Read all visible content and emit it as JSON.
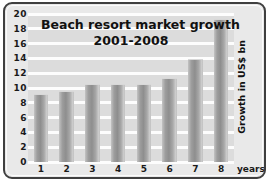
{
  "chart_data": {
    "type": "bar",
    "title": "Beach resort market growth",
    "subtitle": "2001-2008",
    "xlabel": "years",
    "ylabel": "Growth in US$ bn",
    "categories": [
      "1",
      "2",
      "3",
      "4",
      "5",
      "6",
      "7",
      "8"
    ],
    "values": [
      9.0,
      9.4,
      10.4,
      10.4,
      10.4,
      11.2,
      13.8,
      19.2
    ],
    "ylim": [
      0,
      20
    ],
    "ytick_step": 2,
    "yticks": [
      "20",
      "18",
      "16",
      "14",
      "12",
      "10",
      "8",
      "6",
      "4",
      "2",
      "0"
    ],
    "grid": true,
    "legend": "none",
    "bar_color": "#9d9d9d",
    "plot_background": "#dcdcdc",
    "gridline_color": "#fdfdfd",
    "frame_color": "#3f3f3f",
    "text_color": "#111111"
  },
  "axis": {
    "unit_label": "years"
  }
}
